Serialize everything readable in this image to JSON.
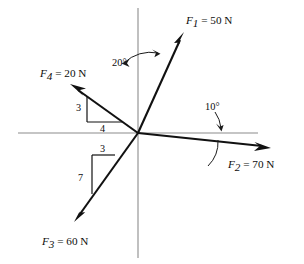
{
  "figure": {
    "type": "free-body-force-diagram",
    "background": "#ffffff",
    "axis_color": "#8c8c8c",
    "vector_color": "#111111",
    "origin": {
      "x": 138,
      "y": 133
    },
    "axes": {
      "vertical": {
        "x": 138,
        "y_top": 8,
        "y_bottom": 258
      },
      "horizontal": {
        "y": 133,
        "x_left": 18,
        "x_right": 258
      }
    }
  },
  "vectors": [
    {
      "id": "F1",
      "label": "F",
      "subscript": "1",
      "equals": " = 50 N",
      "magnitude": 50,
      "unit": "N",
      "tip": {
        "x": 184,
        "y": 33
      },
      "label_pos": {
        "x": 186,
        "y": 22
      },
      "direction_note": "20 degrees from positive vertical axis, toward upper right"
    },
    {
      "id": "F2",
      "label": "F",
      "subscript": "2",
      "equals": " = 70 N",
      "magnitude": 70,
      "unit": "N",
      "tip": {
        "x": 270,
        "y": 148
      },
      "label_pos": {
        "x": 228,
        "y": 166
      },
      "direction_note": "10 degrees below positive horizontal axis, toward right"
    },
    {
      "id": "F3",
      "label": "F",
      "subscript": "3",
      "equals": " = 60 N",
      "magnitude": 60,
      "unit": "N",
      "tip": {
        "x": 74,
        "y": 220
      },
      "label_pos": {
        "x": 43,
        "y": 243
      },
      "direction_note": "down and to the left, slope 3 horizontal to 7 vertical"
    },
    {
      "id": "F4",
      "label": "F",
      "subscript": "4",
      "equals": " = 20 N",
      "magnitude": 20,
      "unit": "N",
      "tip": {
        "x": 71,
        "y": 85
      },
      "label_pos": {
        "x": 40,
        "y": 75
      },
      "direction_note": "up and to the left, slope 3 vertical to 4 horizontal"
    }
  ],
  "angles": [
    {
      "id": "angle-20",
      "text": "20°",
      "value": 20,
      "pos": {
        "x": 112,
        "y": 62
      },
      "measured_from": "vertical-axis",
      "to_vector": "F1"
    },
    {
      "id": "angle-10",
      "text": "10°",
      "value": 10,
      "pos": {
        "x": 211,
        "y": 106
      },
      "measured_from": "horizontal-axis",
      "to_vector": "F2"
    }
  ],
  "slope_triangles": [
    {
      "id": "triangle-f4",
      "for_vector": "F4",
      "rise_label": "3",
      "run_label": "4",
      "rise_pos": {
        "x": 78,
        "y": 108
      },
      "run_pos": {
        "x": 95,
        "y": 127
      }
    },
    {
      "id": "triangle-f3",
      "for_vector": "F3",
      "rise_label": "7",
      "run_label": "3",
      "rise_pos": {
        "x": 82,
        "y": 183
      },
      "run_pos": {
        "x": 104,
        "y": 157
      }
    }
  ]
}
